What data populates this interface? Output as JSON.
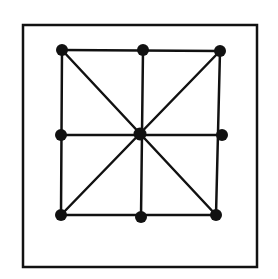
{
  "diagram": {
    "colors": {
      "ink": "#111111",
      "background": "#ffffff"
    },
    "frame": {
      "x1": 23,
      "y1": 25,
      "x2": 257,
      "y2": 267
    },
    "points": [
      {
        "id": "top-left",
        "x": 62,
        "y": 50
      },
      {
        "id": "top-middle",
        "x": 143,
        "y": 50
      },
      {
        "id": "top-right",
        "x": 220,
        "y": 51
      },
      {
        "id": "middle-left",
        "x": 61,
        "y": 135
      },
      {
        "id": "center",
        "x": 140,
        "y": 134
      },
      {
        "id": "middle-right",
        "x": 222,
        "y": 135
      },
      {
        "id": "bottom-left",
        "x": 61,
        "y": 215
      },
      {
        "id": "bottom-middle",
        "x": 141,
        "y": 217
      },
      {
        "id": "bottom-right",
        "x": 216,
        "y": 215
      }
    ],
    "lines": [
      [
        "top-left",
        "top-right"
      ],
      [
        "middle-left",
        "middle-right"
      ],
      [
        "bottom-left",
        "bottom-right"
      ],
      [
        "top-left",
        "bottom-left"
      ],
      [
        "top-middle",
        "bottom-middle"
      ],
      [
        "top-right",
        "bottom-right"
      ],
      [
        "top-left",
        "bottom-right"
      ],
      [
        "top-right",
        "bottom-left"
      ]
    ]
  }
}
